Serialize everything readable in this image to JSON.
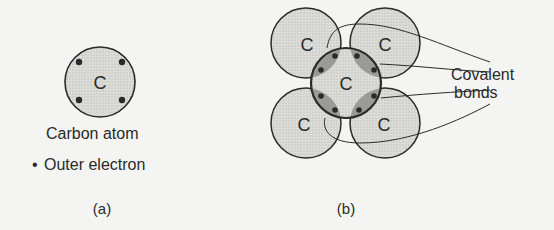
{
  "panel_a": {
    "atom_symbol": "C",
    "caption": "Carbon atom",
    "legend_bullet": "•",
    "legend_text": "Outer electron",
    "label": "(a)"
  },
  "panel_b": {
    "atoms": [
      {
        "position": "center",
        "symbol": "C"
      },
      {
        "position": "top-left",
        "symbol": "C"
      },
      {
        "position": "top-right",
        "symbol": "C"
      },
      {
        "position": "bottom-left",
        "symbol": "C"
      },
      {
        "position": "bottom-right",
        "symbol": "C"
      }
    ],
    "callout_line1": "Covalent",
    "callout_line2": "bonds",
    "label": "(b)"
  },
  "colors": {
    "background": "#f4f4f2",
    "atom_fill": "#d9d9d6",
    "bond_fill": "#9a9a97",
    "outline": "#2a2a2a",
    "electron": "#2a2a2a"
  }
}
